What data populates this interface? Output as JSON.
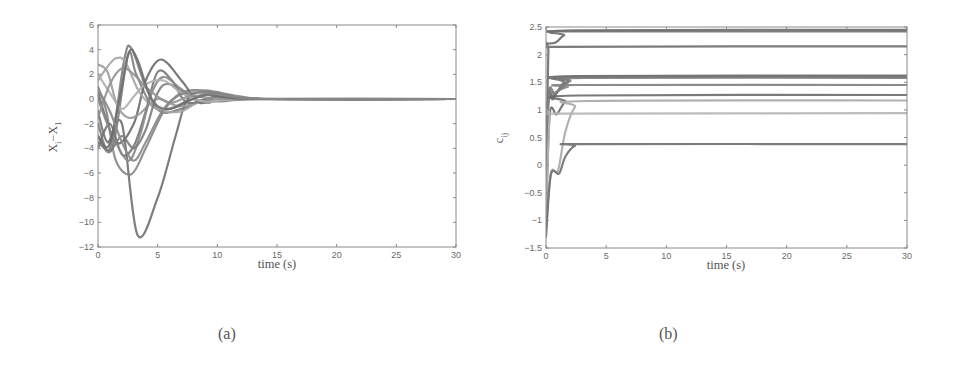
{
  "figures": {
    "a": {
      "caption": "(a)",
      "xlabel": "time (s)",
      "ylabel": "X_i − X_1",
      "ylabel_main": "X",
      "ylabel_sub1": "i",
      "ylabel_mid": "−X",
      "ylabel_sub2": "1"
    },
    "b": {
      "caption": "(b)",
      "xlabel": "time (s)",
      "ylabel": "c_ij",
      "ylabel_main": "c",
      "ylabel_sub": "ij"
    }
  },
  "chart_data": [
    {
      "id": "a",
      "type": "line",
      "title": "",
      "xlabel": "time (s)",
      "ylabel": "X_i − X_1",
      "xlim": [
        0,
        30
      ],
      "ylim": [
        -12,
        6
      ],
      "xticks": [
        0,
        5,
        10,
        15,
        20,
        25,
        30
      ],
      "yticks": [
        -12,
        -10,
        -8,
        -6,
        -4,
        -2,
        0,
        2,
        4,
        6
      ],
      "grid": false,
      "legend": null,
      "box": {
        "left": 98,
        "top": 25,
        "right": 456,
        "bottom": 247
      },
      "series": [
        {
          "name": "s1",
          "color": "#6f6f6f",
          "points": [
            [
              0,
              -1
            ],
            [
              0.8,
              -3.5
            ],
            [
              2,
              -2
            ],
            [
              3.3,
              -11
            ],
            [
              5,
              -8
            ],
            [
              6.5,
              -3
            ],
            [
              7.5,
              0
            ],
            [
              9,
              0.6
            ],
            [
              11,
              0.3
            ],
            [
              14,
              0
            ],
            [
              30,
              0
            ]
          ]
        },
        {
          "name": "s2",
          "color": "#7a7a7a",
          "points": [
            [
              0,
              -2
            ],
            [
              1,
              -4
            ],
            [
              2.2,
              3.2
            ],
            [
              2.8,
              4.1
            ],
            [
              4,
              1
            ],
            [
              5.2,
              -1
            ],
            [
              7,
              -0.8
            ],
            [
              10,
              0.2
            ],
            [
              14,
              0
            ],
            [
              30,
              0
            ]
          ]
        },
        {
          "name": "s3",
          "color": "#858585",
          "points": [
            [
              0,
              1
            ],
            [
              0.7,
              -1
            ],
            [
              1.5,
              -5
            ],
            [
              2.8,
              -6.1
            ],
            [
              4,
              -4
            ],
            [
              5.5,
              -1
            ],
            [
              7,
              0.5
            ],
            [
              9,
              0.7
            ],
            [
              12,
              0.2
            ],
            [
              15,
              0
            ],
            [
              30,
              0
            ]
          ]
        },
        {
          "name": "s4",
          "color": "#808080",
          "points": [
            [
              0,
              -3
            ],
            [
              1.2,
              -4
            ],
            [
              2.5,
              3.5
            ],
            [
              3.2,
              2
            ],
            [
              4.5,
              -0.5
            ],
            [
              6,
              -0.8
            ],
            [
              9,
              0.4
            ],
            [
              13,
              0
            ],
            [
              30,
              0
            ]
          ]
        },
        {
          "name": "s5",
          "color": "#6a6a6a",
          "points": [
            [
              0,
              0.5
            ],
            [
              1.5,
              -3.5
            ],
            [
              3,
              -2
            ],
            [
              4,
              1.5
            ],
            [
              5.3,
              3.2
            ],
            [
              7,
              1.5
            ],
            [
              8.5,
              -0.3
            ],
            [
              10,
              0.1
            ],
            [
              14,
              0
            ],
            [
              30,
              0
            ]
          ]
        },
        {
          "name": "s6",
          "color": "#9a9a9a",
          "points": [
            [
              0,
              2.8
            ],
            [
              0.8,
              2.2
            ],
            [
              1.6,
              -0.5
            ],
            [
              2.5,
              -1.5
            ],
            [
              3.5,
              -1.2
            ],
            [
              5,
              0
            ],
            [
              7,
              -0.6
            ],
            [
              10,
              0.2
            ],
            [
              14,
              0
            ],
            [
              30,
              0
            ]
          ]
        },
        {
          "name": "s7",
          "color": "#a5a5a5",
          "points": [
            [
              0,
              1.5
            ],
            [
              0.7,
              2.5
            ],
            [
              1.5,
              3.3
            ],
            [
              2.3,
              3.0
            ],
            [
              3.5,
              0.5
            ],
            [
              5,
              -0.8
            ],
            [
              7,
              -1
            ],
            [
              9,
              0
            ],
            [
              13,
              0
            ],
            [
              30,
              0
            ]
          ]
        },
        {
          "name": "s8",
          "color": "#757575",
          "points": [
            [
              0,
              -4
            ],
            [
              1,
              -2
            ],
            [
              2,
              -4.5
            ],
            [
              3,
              -3.8
            ],
            [
              4,
              -1
            ],
            [
              5,
              2.2
            ],
            [
              6.2,
              1.5
            ],
            [
              7.5,
              -0.3
            ],
            [
              10,
              0.2
            ],
            [
              14,
              0
            ],
            [
              30,
              0
            ]
          ]
        },
        {
          "name": "s9",
          "color": "#8a8a8a",
          "points": [
            [
              0,
              0
            ],
            [
              1,
              -2.5
            ],
            [
              2.5,
              -5
            ],
            [
              3.5,
              -3
            ],
            [
              4.5,
              0.5
            ],
            [
              5.5,
              1.8
            ],
            [
              7,
              0.8
            ],
            [
              9,
              -0.3
            ],
            [
              12,
              0
            ],
            [
              30,
              0
            ]
          ]
        },
        {
          "name": "s10",
          "color": "#7c7c7c",
          "points": [
            [
              0,
              -3.5
            ],
            [
              1,
              -4.2
            ],
            [
              2,
              -3
            ],
            [
              3,
              -4
            ],
            [
              4,
              -2.5
            ],
            [
              5,
              0.5
            ],
            [
              6,
              1.2
            ],
            [
              8,
              0
            ],
            [
              10,
              -0.2
            ],
            [
              14,
              0
            ],
            [
              30,
              0
            ]
          ]
        },
        {
          "name": "s11",
          "color": "#b0b0b0",
          "points": [
            [
              0,
              2
            ],
            [
              1,
              0.5
            ],
            [
              2,
              -0.8
            ],
            [
              3,
              0.2
            ],
            [
              4,
              1.2
            ],
            [
              5.5,
              1.5
            ],
            [
              7,
              0.5
            ],
            [
              9,
              -0.2
            ],
            [
              13,
              0
            ],
            [
              30,
              0
            ]
          ]
        },
        {
          "name": "s12",
          "color": "#929292",
          "points": [
            [
              0,
              -1.5
            ],
            [
              1,
              1.2
            ],
            [
              2,
              2.5
            ],
            [
              3,
              2
            ],
            [
              4.2,
              0.8
            ],
            [
              6,
              -0.3
            ],
            [
              8,
              0.3
            ],
            [
              11,
              0
            ],
            [
              30,
              0
            ]
          ]
        },
        {
          "name": "s13",
          "color": "#6e6e6e",
          "points": [
            [
              0,
              -3
            ],
            [
              0.9,
              -3.8
            ],
            [
              1.8,
              0
            ],
            [
              2.6,
              3.8
            ],
            [
              3.3,
              3.2
            ],
            [
              4.5,
              0
            ],
            [
              6,
              -0.8
            ],
            [
              9,
              0.3
            ],
            [
              13,
              0
            ],
            [
              30,
              0
            ]
          ]
        },
        {
          "name": "s14",
          "color": "#888888",
          "points": [
            [
              0,
              0.8
            ],
            [
              1,
              -1
            ],
            [
              2,
              -3.5
            ],
            [
              3,
              -5
            ],
            [
              4,
              -3.5
            ],
            [
              5.5,
              -0.8
            ],
            [
              7,
              0.4
            ],
            [
              9,
              0.5
            ],
            [
              12,
              0.1
            ],
            [
              15,
              0
            ],
            [
              30,
              0
            ]
          ]
        }
      ]
    },
    {
      "id": "b",
      "type": "line",
      "title": "",
      "xlabel": "time (s)",
      "ylabel": "c_ij",
      "xlim": [
        0,
        30
      ],
      "ylim": [
        -1.5,
        2.5
      ],
      "xticks": [
        0,
        5,
        10,
        15,
        20,
        25,
        30
      ],
      "yticks": [
        -1.5,
        -1,
        -0.5,
        0,
        0.5,
        1,
        1.5,
        2,
        2.5
      ],
      "ytick_labels": [
        "−1.5",
        "−1",
        "−0.5",
        "0",
        "0.5",
        "1",
        "1.5",
        "2",
        "2.5"
      ],
      "grid": false,
      "legend": null,
      "box": {
        "left": 546,
        "top": 27,
        "right": 907,
        "bottom": 248
      },
      "series": [
        {
          "name": "c1",
          "color": "#6a6a6a",
          "final": 2.45,
          "points": [
            [
              0,
              2.2
            ],
            [
              0.8,
              2.22
            ],
            [
              1.5,
              2.35
            ],
            [
              2.5,
              2.44
            ],
            [
              30,
              2.45
            ]
          ]
        },
        {
          "name": "c2",
          "color": "#707070",
          "final": 2.42,
          "points": [
            [
              0,
              2.42
            ],
            [
              30,
              2.42
            ]
          ]
        },
        {
          "name": "c3",
          "color": "#6e6e6e",
          "final": 2.15,
          "points": [
            [
              0,
              -1.1
            ],
            [
              0.2,
              2.05
            ],
            [
              0.5,
              2.14
            ],
            [
              30,
              2.15
            ]
          ]
        },
        {
          "name": "c4",
          "color": "#6a6a6a",
          "final": 1.62,
          "points": [
            [
              0,
              -1.0
            ],
            [
              0.15,
              1.1
            ],
            [
              0.6,
              1.2
            ],
            [
              1.5,
              1.5
            ],
            [
              2.5,
              1.61
            ],
            [
              30,
              1.62
            ]
          ]
        },
        {
          "name": "c5",
          "color": "#727272",
          "final": 1.6,
          "points": [
            [
              0,
              -0.9
            ],
            [
              0.2,
              1.2
            ],
            [
              0.6,
              1.25
            ],
            [
              1.8,
              1.52
            ],
            [
              3,
              1.6
            ],
            [
              30,
              1.6
            ]
          ]
        },
        {
          "name": "c6",
          "color": "#7a7a7a",
          "final": 1.58,
          "points": [
            [
              0,
              -0.8
            ],
            [
              0.2,
              1.25
            ],
            [
              0.8,
              1.3
            ],
            [
              2,
              1.52
            ],
            [
              3.2,
              1.58
            ],
            [
              30,
              1.58
            ]
          ]
        },
        {
          "name": "c7",
          "color": "#7e7e7e",
          "final": 1.45,
          "points": [
            [
              0,
              -1.0
            ],
            [
              0.2,
              1.1
            ],
            [
              0.7,
              1.3
            ],
            [
              1.8,
              1.42
            ],
            [
              2.8,
              1.45
            ],
            [
              30,
              1.45
            ]
          ]
        },
        {
          "name": "c8",
          "color": "#6c6c6c",
          "final": 1.27,
          "points": [
            [
              0,
              -1.1
            ],
            [
              0.3,
              0.9
            ],
            [
              0.9,
              0.92
            ],
            [
              1.6,
              1.15
            ],
            [
              2.6,
              1.26
            ],
            [
              30,
              1.27
            ]
          ]
        },
        {
          "name": "c9",
          "color": "#a8a8a8",
          "final": 1.17,
          "points": [
            [
              0,
              -1.2
            ],
            [
              0.4,
              -0.15
            ],
            [
              1.0,
              -0.1
            ],
            [
              1.6,
              0.6
            ],
            [
              2.4,
              1.05
            ],
            [
              3.5,
              1.16
            ],
            [
              30,
              1.17
            ]
          ]
        },
        {
          "name": "c10",
          "color": "#b5b5b5",
          "final": 0.94,
          "points": [
            [
              0,
              -0.9
            ],
            [
              0.3,
              0.9
            ],
            [
              0.6,
              0.93
            ],
            [
              30,
              0.94
            ]
          ]
        },
        {
          "name": "c11",
          "color": "#6f6f6f",
          "final": 0.38,
          "points": [
            [
              0,
              -1.3
            ],
            [
              0.4,
              -0.18
            ],
            [
              1.1,
              -0.15
            ],
            [
              1.6,
              0.15
            ],
            [
              2.4,
              0.35
            ],
            [
              3.5,
              0.38
            ],
            [
              30,
              0.38
            ]
          ]
        }
      ]
    }
  ]
}
